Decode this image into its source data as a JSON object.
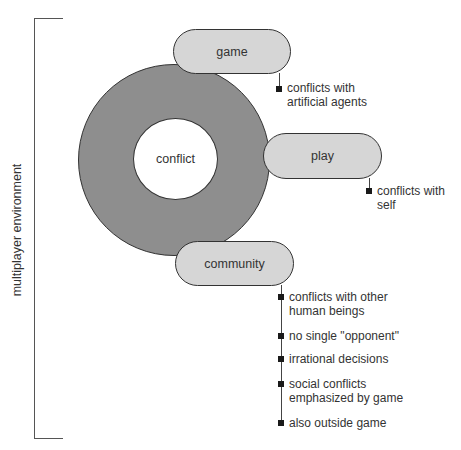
{
  "diagram": {
    "environment_label": "multiplayer environment",
    "center_label": "conflict",
    "nodes": [
      {
        "id": "game",
        "label": "game",
        "notes": [
          {
            "line1": "conflicts with",
            "line2": "artificial agents"
          }
        ]
      },
      {
        "id": "play",
        "label": "play",
        "notes": [
          {
            "line1": "conflicts with",
            "line2": "self"
          }
        ]
      },
      {
        "id": "community",
        "label": "community",
        "notes": [
          {
            "line1": "conflicts with other",
            "line2": "human beings"
          },
          {
            "line1": "no single \"opponent\"",
            "line2": ""
          },
          {
            "line1": "irrational decisions",
            "line2": ""
          },
          {
            "line1": "social conflicts",
            "line2": "emphasized by game"
          },
          {
            "line1": "also outside game",
            "line2": ""
          }
        ]
      }
    ],
    "colors": {
      "ring": "#8e8e8e",
      "pill": "#d6d6d6",
      "outline": "#333333",
      "bullet": "#1a1a1a"
    }
  }
}
